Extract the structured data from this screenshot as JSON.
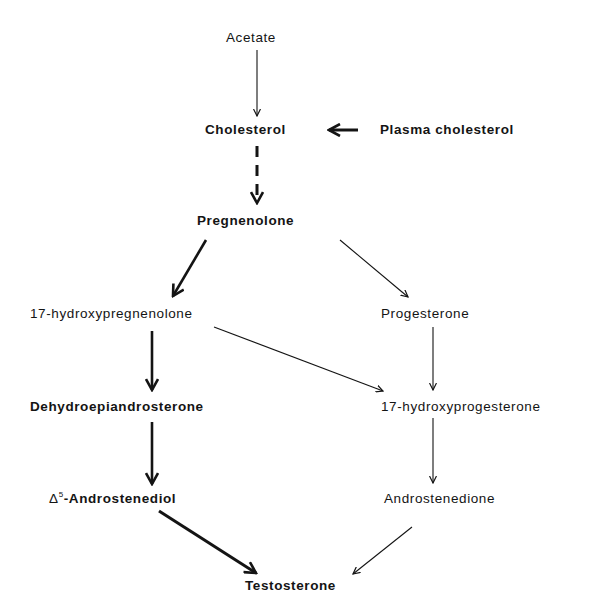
{
  "diagram": {
    "type": "biosynthetic-pathway",
    "nodes": {
      "acetate": "Acetate",
      "cholesterol": "Cholesterol",
      "plasma_cholesterol": "Plasma cholesterol",
      "pregnenolone": "Pregnenolone",
      "hydroxypregnenolone": "17-hydroxypregnenolone",
      "progesterone": "Progesterone",
      "dhea": "Dehydroepiandrosterone",
      "hydroxyprogesterone": "17-hydroxyprogesterone",
      "androstenediol_prefix": "Δ",
      "androstenediol_sup": "5",
      "androstenediol_name": "-Androstenediol",
      "androstenedione": "Androstenedione",
      "testosterone": "Testosterone"
    },
    "edges": [
      {
        "from": "Acetate",
        "to": "Cholesterol",
        "style": "thin"
      },
      {
        "from": "Plasma cholesterol",
        "to": "Cholesterol",
        "style": "thick"
      },
      {
        "from": "Cholesterol",
        "to": "Pregnenolone",
        "style": "dashed-thick"
      },
      {
        "from": "Pregnenolone",
        "to": "17-hydroxypregnenolone",
        "style": "thick"
      },
      {
        "from": "Pregnenolone",
        "to": "Progesterone",
        "style": "thin"
      },
      {
        "from": "17-hydroxypregnenolone",
        "to": "Dehydroepiandrosterone",
        "style": "thick"
      },
      {
        "from": "17-hydroxypregnenolone",
        "to": "17-hydroxyprogesterone",
        "style": "thin"
      },
      {
        "from": "Progesterone",
        "to": "17-hydroxyprogesterone",
        "style": "thin"
      },
      {
        "from": "Dehydroepiandrosterone",
        "to": "Δ5-Androstenediol",
        "style": "thick"
      },
      {
        "from": "17-hydroxyprogesterone",
        "to": "Androstenedione",
        "style": "thin"
      },
      {
        "from": "Δ5-Androstenediol",
        "to": "Testosterone",
        "style": "thick"
      },
      {
        "from": "Androstenedione",
        "to": "Testosterone",
        "style": "thin"
      }
    ],
    "colors": {
      "ink": "#141414",
      "background": "#ffffff"
    }
  }
}
